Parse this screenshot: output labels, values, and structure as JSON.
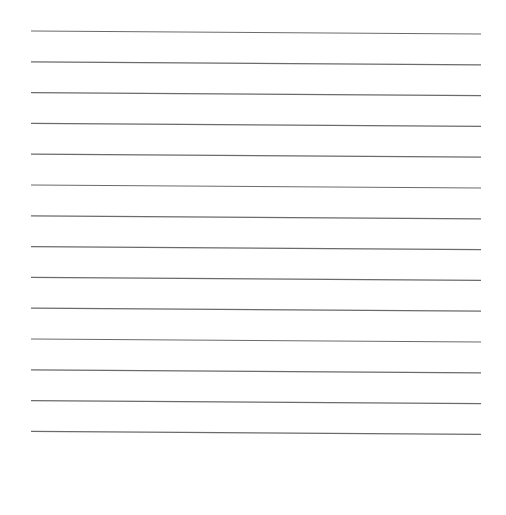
{
  "page": {
    "type": "lined-paper",
    "line_count": 14,
    "line_color": "#6b6b6b",
    "background": "#ffffff"
  },
  "lines": {
    "x_start": 31,
    "x_end": 481,
    "y_first_left": 31,
    "spacing": 30.8,
    "slope_drop": 3
  }
}
